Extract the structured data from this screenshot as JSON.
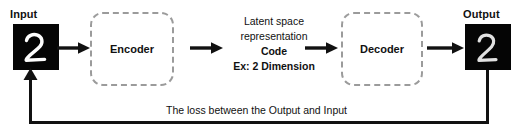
{
  "diagram": {
    "input": {
      "label": "Input",
      "image_name": "handwritten-digit-2",
      "digit": "2"
    },
    "output": {
      "label": "Output",
      "image_name": "reconstructed-handwritten-digit-2",
      "digit": "2"
    },
    "encoder": {
      "label": "Encoder"
    },
    "decoder": {
      "label": "Decoder"
    },
    "latent": {
      "line1": "Latent space",
      "line2": "representation",
      "line3": "Code",
      "line4": "Ex: 2 Dimension"
    },
    "loss": {
      "caption": "The loss between the Output and Input"
    },
    "arrows": [
      {
        "name": "input-to-encoder"
      },
      {
        "name": "encoder-to-latent"
      },
      {
        "name": "latent-to-decoder"
      },
      {
        "name": "decoder-to-output"
      }
    ],
    "colors": {
      "stroke": "#111111",
      "dashed_border": "#9b9b9b",
      "tile_background": "#050505",
      "digit": "#fdfdfd",
      "page_background": "#ffffff"
    }
  }
}
